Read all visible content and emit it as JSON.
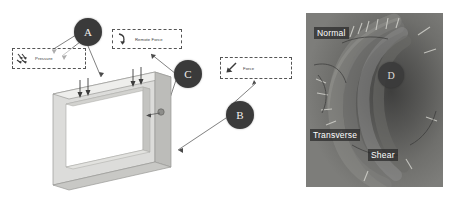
{
  "figure": {
    "type": "annotated-fea-diagram",
    "left_panel": {
      "model_name": "rectangular-hollow-frame",
      "callouts": [
        {
          "id": "pressure",
          "label": "Pressure",
          "icon": "pressure-arrows-icon"
        },
        {
          "id": "remote_force",
          "label": "Remote Force",
          "icon": "bent-arrow-icon"
        },
        {
          "id": "force",
          "label": "Force",
          "icon": "diagonal-arrow-icon"
        }
      ],
      "badges": [
        {
          "id": "a",
          "label": "A"
        },
        {
          "id": "b",
          "label": "B"
        },
        {
          "id": "c",
          "label": "C"
        }
      ]
    },
    "right_panel": {
      "badges": [
        {
          "id": "d",
          "label": "D"
        }
      ],
      "tags": [
        {
          "id": "normal",
          "label": "Normal"
        },
        {
          "id": "transverse",
          "label": "Transverse"
        },
        {
          "id": "shear",
          "label": "Shear"
        }
      ]
    },
    "colors": {
      "badge_fill": "#3a3a3a",
      "badge_text": "#f0efed",
      "dash_border": "#555555",
      "frame_face": "#d8d8d6",
      "frame_top": "#eeeeec",
      "frame_side": "#b9b9b6",
      "panel_base": "#6d6d6b"
    }
  }
}
